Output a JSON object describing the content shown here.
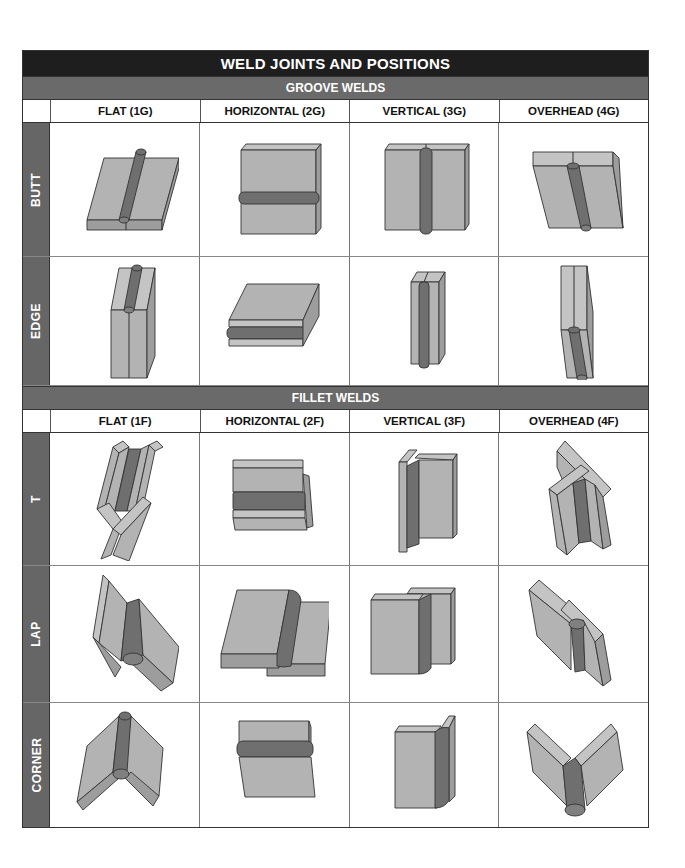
{
  "title": "WELD JOINTS AND POSITIONS",
  "groove": {
    "label": "GROOVE WELDS",
    "columns": [
      "FLAT (1G)",
      "HORIZONTAL (2G)",
      "VERTICAL (3G)",
      "OVERHEAD (4G)"
    ],
    "rows": [
      {
        "label": "BUTT",
        "cells": [
          "butt-flat-1g",
          "butt-horizontal-2g",
          "butt-vertical-3g",
          "butt-overhead-4g"
        ]
      },
      {
        "label": "EDGE",
        "cells": [
          "edge-flat-1g",
          "edge-horizontal-2g",
          "edge-vertical-3g",
          "edge-overhead-4g"
        ]
      }
    ]
  },
  "fillet": {
    "label": "FILLET WELDS",
    "columns": [
      "FLAT (1F)",
      "HORIZONTAL (2F)",
      "VERTICAL (3F)",
      "OVERHEAD (4F)"
    ],
    "rows": [
      {
        "label": "T",
        "cells": [
          "t-flat-1f",
          "t-horizontal-2f",
          "t-vertical-3f",
          "t-overhead-4f"
        ]
      },
      {
        "label": "LAP",
        "cells": [
          "lap-flat-1f",
          "lap-horizontal-2f",
          "lap-vertical-3f",
          "lap-overhead-4f"
        ]
      },
      {
        "label": "CORNER",
        "cells": [
          "corner-flat-1f",
          "corner-horizontal-2f",
          "corner-vertical-3f",
          "corner-overhead-4f"
        ]
      }
    ]
  },
  "colors": {
    "title_band": "#1e1e1e",
    "section_band": "#6a6a6a",
    "side_label": "#666666",
    "plate": "#b3b3b3",
    "weld_bead": "#6f6f6f"
  }
}
